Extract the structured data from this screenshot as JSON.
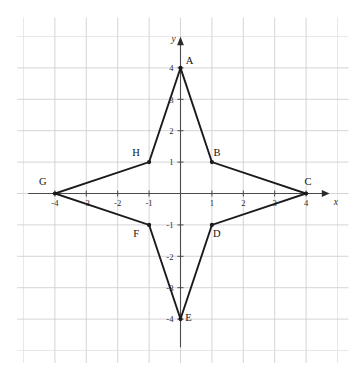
{
  "figure": {
    "kind": "coordinate-plane-polygon",
    "axes": {
      "x_axis_name": "x",
      "y_axis_name": "y",
      "x_ticks": [
        "-4",
        "-3",
        "-2",
        "-1",
        "1",
        "2",
        "3",
        "4"
      ],
      "y_ticks": [
        "4",
        "3",
        "2",
        "1",
        "-1",
        "-2",
        "-3",
        "-4"
      ],
      "x_range": [
        -4.5,
        4.5
      ],
      "y_range": [
        -4.5,
        4.5
      ],
      "grid": true,
      "grid_color": "#c9c9cf",
      "axis_color": "#4a4a4a"
    },
    "polygon": {
      "stroke_color": "#1b1b1b",
      "closed": true,
      "vertices": [
        {
          "label": "A",
          "x": 0,
          "y": 4,
          "label_dx": 9,
          "label_dy": -4
        },
        {
          "label": "B",
          "x": 1,
          "y": 1,
          "label_dx": 5,
          "label_dy": -6
        },
        {
          "label": "C",
          "x": 4,
          "y": 0,
          "label_dx": 2,
          "label_dy": -9
        },
        {
          "label": "D",
          "x": 1,
          "y": -1,
          "label_dx": 5,
          "label_dy": 12
        },
        {
          "label": "E",
          "x": 0,
          "y": -4,
          "label_dx": 8,
          "label_dy": 2
        },
        {
          "label": "F",
          "x": -1,
          "y": -1,
          "label_dx": -13,
          "label_dy": 12
        },
        {
          "label": "G",
          "x": -4,
          "y": 0,
          "label_dx": -12,
          "label_dy": -9
        },
        {
          "label": "H",
          "x": -1,
          "y": 1,
          "label_dx": -13,
          "label_dy": -6
        }
      ]
    }
  }
}
